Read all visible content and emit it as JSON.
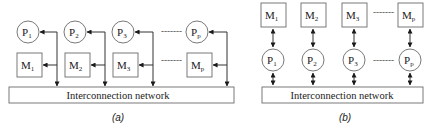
{
  "diagram_a": {
    "caption": "(a)",
    "network_label": "Interconnection network",
    "processors": [
      {
        "main": "P",
        "sub": "1"
      },
      {
        "main": "P",
        "sub": "2"
      },
      {
        "main": "P",
        "sub": "3"
      },
      {
        "main": "P",
        "sub": "p"
      }
    ],
    "memories": [
      {
        "main": "M",
        "sub": "1"
      },
      {
        "main": "M",
        "sub": "2"
      },
      {
        "main": "M",
        "sub": "3"
      },
      {
        "main": "M",
        "sub": "p"
      }
    ],
    "ellipsis": "-------"
  },
  "diagram_b": {
    "caption": "(b)",
    "network_label": "Interconnection network",
    "processors": [
      {
        "main": "P",
        "sub": "1"
      },
      {
        "main": "P",
        "sub": "2"
      },
      {
        "main": "P",
        "sub": "3"
      },
      {
        "main": "P",
        "sub": "p"
      }
    ],
    "memories": [
      {
        "main": "M",
        "sub": "1"
      },
      {
        "main": "M",
        "sub": "2"
      },
      {
        "main": "M",
        "sub": "3"
      },
      {
        "main": "M",
        "sub": "p"
      }
    ],
    "ellipsis": "-------"
  },
  "colors": {
    "stroke": "#6a6a6a",
    "text": "#1a1a1a",
    "background": "#ffffff"
  }
}
